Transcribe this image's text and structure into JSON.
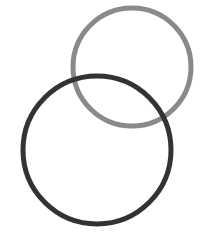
{
  "diagram": {
    "type": "venn",
    "canvas": {
      "width": 206,
      "height": 243,
      "background": "#ffffff"
    },
    "circles": [
      {
        "name": "upper-right-circle",
        "cx": 132,
        "cy": 67,
        "r": 59,
        "stroke": "#8a8a8a",
        "stroke_width": 5
      },
      {
        "name": "lower-left-circle",
        "cx": 97,
        "cy": 150,
        "r": 74,
        "stroke": "#333333",
        "stroke_width": 5
      }
    ]
  }
}
